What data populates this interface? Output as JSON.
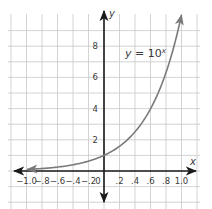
{
  "chart_data": {
    "type": "line",
    "title": "",
    "equation_label": "y = 10",
    "equation_exponent": "x",
    "xlabel": "x",
    "ylabel": "y",
    "xlim": [
      -1.0,
      1.0
    ],
    "ylim": [
      -1.9,
      10.2
    ],
    "grid": true,
    "x_ticks": [
      -1.0,
      -0.8,
      -0.6,
      -0.4,
      -0.2,
      0,
      0.2,
      0.4,
      0.6,
      0.8,
      1.0
    ],
    "x_tick_labels": [
      "−1.0",
      "−.8",
      "−.6",
      "−.4",
      "−.2",
      "0",
      ".2",
      ".4",
      ".6",
      ".8",
      "1.0"
    ],
    "y_ticks": [
      2,
      4,
      6,
      8
    ],
    "y_tick_labels": [
      "2",
      "4",
      "6",
      "8"
    ],
    "series": [
      {
        "name": "y = 10^x",
        "function": "10^x",
        "x": [
          -1.0,
          -0.8,
          -0.6,
          -0.4,
          -0.2,
          0,
          0.2,
          0.4,
          0.6,
          0.8,
          1.0
        ],
        "values": [
          0.1,
          0.16,
          0.25,
          0.4,
          0.63,
          1.0,
          1.58,
          2.51,
          3.98,
          6.31,
          10.0
        ],
        "color": "#7a7a7a",
        "arrows": "both"
      }
    ]
  },
  "colors": {
    "axis": "#1a1a1a",
    "grid": "#c8c8c8",
    "curve": "#7a7a7a",
    "text": "#3a3a3a"
  }
}
